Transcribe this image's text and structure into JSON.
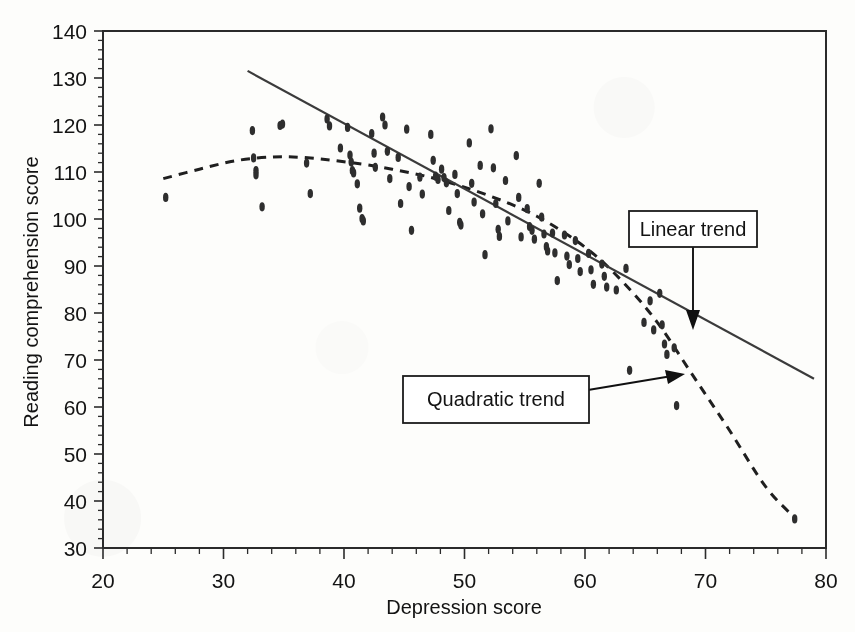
{
  "figure": {
    "background_color": "#fdfdfb",
    "axis_color": "#2b2b2b",
    "marker_color": "#2e2e2e",
    "linear_color": "#3b3b3b",
    "quadratic_color": "#1f1f1f"
  },
  "chart_data": {
    "type": "scatter",
    "title": "",
    "subtitle": "",
    "xlabel": "Depression score",
    "ylabel": "Reading comprehension score",
    "xlim": [
      20,
      80
    ],
    "ylim": [
      30,
      140
    ],
    "xticks": [
      20,
      30,
      40,
      50,
      60,
      70,
      80
    ],
    "yticks": [
      30,
      40,
      50,
      60,
      70,
      80,
      90,
      100,
      110,
      120,
      130,
      140
    ],
    "xtick_labels": [
      "20",
      "30",
      "40",
      "50",
      "60",
      "70",
      "80"
    ],
    "ytick_labels": [
      "30",
      "40",
      "50",
      "60",
      "70",
      "80",
      "90",
      "100",
      "110",
      "120",
      "130",
      "140"
    ],
    "xtick_minor_step": 2,
    "ytick_minor_step": 2,
    "grid": false,
    "legend": false,
    "legend_position": "none",
    "marker_shape": "filled-vertical-ellipse",
    "points": [
      [
        25.2,
        104.6
      ],
      [
        32.4,
        118.8
      ],
      [
        32.5,
        113.0
      ],
      [
        32.7,
        110.3
      ],
      [
        32.7,
        109.4
      ],
      [
        33.2,
        102.6
      ],
      [
        34.7,
        119.9
      ],
      [
        34.9,
        120.2
      ],
      [
        36.9,
        111.9
      ],
      [
        37.2,
        105.4
      ],
      [
        38.6,
        121.3
      ],
      [
        38.8,
        119.8
      ],
      [
        39.7,
        115.1
      ],
      [
        40.3,
        119.5
      ],
      [
        40.5,
        113.6
      ],
      [
        40.6,
        112.1
      ],
      [
        40.7,
        110.3
      ],
      [
        40.8,
        109.8
      ],
      [
        41.1,
        107.5
      ],
      [
        41.3,
        102.3
      ],
      [
        41.5,
        100.1
      ],
      [
        41.6,
        99.6
      ],
      [
        42.3,
        118.2
      ],
      [
        42.5,
        114.0
      ],
      [
        42.6,
        111.0
      ],
      [
        43.2,
        121.7
      ],
      [
        43.4,
        120.0
      ],
      [
        43.6,
        114.4
      ],
      [
        43.8,
        108.6
      ],
      [
        44.5,
        113.1
      ],
      [
        44.7,
        103.3
      ],
      [
        45.2,
        119.1
      ],
      [
        45.4,
        106.9
      ],
      [
        45.6,
        97.6
      ],
      [
        46.3,
        108.9
      ],
      [
        46.5,
        105.3
      ],
      [
        47.2,
        118.0
      ],
      [
        47.4,
        112.5
      ],
      [
        47.6,
        109.1
      ],
      [
        47.8,
        108.4
      ],
      [
        48.1,
        110.6
      ],
      [
        48.3,
        108.8
      ],
      [
        48.5,
        107.7
      ],
      [
        48.7,
        101.8
      ],
      [
        49.2,
        109.5
      ],
      [
        49.4,
        105.4
      ],
      [
        49.6,
        99.3
      ],
      [
        49.7,
        98.7
      ],
      [
        50.4,
        116.2
      ],
      [
        50.6,
        107.6
      ],
      [
        50.8,
        103.6
      ],
      [
        51.3,
        111.4
      ],
      [
        51.5,
        101.1
      ],
      [
        51.7,
        92.4
      ],
      [
        52.2,
        119.2
      ],
      [
        52.4,
        110.9
      ],
      [
        52.6,
        103.3
      ],
      [
        52.8,
        97.8
      ],
      [
        52.9,
        96.3
      ],
      [
        53.4,
        108.2
      ],
      [
        53.6,
        99.6
      ],
      [
        54.3,
        113.5
      ],
      [
        54.5,
        104.6
      ],
      [
        54.7,
        96.2
      ],
      [
        55.2,
        102.2
      ],
      [
        55.4,
        98.4
      ],
      [
        55.6,
        97.6
      ],
      [
        55.8,
        95.7
      ],
      [
        56.2,
        107.6
      ],
      [
        56.4,
        100.4
      ],
      [
        56.6,
        96.8
      ],
      [
        56.8,
        94.1
      ],
      [
        56.9,
        93.2
      ],
      [
        57.3,
        97.0
      ],
      [
        57.5,
        92.8
      ],
      [
        57.7,
        86.9
      ],
      [
        58.3,
        96.6
      ],
      [
        58.5,
        92.1
      ],
      [
        58.7,
        90.3
      ],
      [
        59.2,
        95.4
      ],
      [
        59.4,
        91.6
      ],
      [
        59.6,
        88.8
      ],
      [
        60.3,
        92.7
      ],
      [
        60.5,
        89.2
      ],
      [
        60.7,
        86.1
      ],
      [
        61.4,
        90.4
      ],
      [
        61.6,
        87.8
      ],
      [
        61.8,
        85.5
      ],
      [
        62.6,
        84.9
      ],
      [
        63.4,
        89.5
      ],
      [
        63.7,
        67.8
      ],
      [
        64.9,
        78.0
      ],
      [
        65.4,
        82.6
      ],
      [
        65.7,
        76.4
      ],
      [
        66.2,
        84.2
      ],
      [
        66.4,
        77.5
      ],
      [
        66.6,
        73.4
      ],
      [
        66.8,
        71.2
      ],
      [
        67.4,
        72.6
      ],
      [
        67.6,
        60.3
      ],
      [
        77.4,
        36.2
      ]
    ],
    "series": [
      {
        "name": "Linear trend",
        "type": "line",
        "style": "solid",
        "x": [
          32.0,
          79.0
        ],
        "y": [
          131.5,
          66.0
        ]
      },
      {
        "name": "Quadratic trend",
        "type": "line",
        "style": "dashed",
        "x": [
          25.0,
          28.0,
          31.0,
          34.0,
          36.5,
          40.0,
          44.0,
          48.0,
          52.0,
          56.0,
          60.0,
          63.0,
          66.0,
          69.0,
          72.0,
          75.0,
          77.5
        ],
        "y": [
          108.6,
          110.6,
          112.4,
          113.2,
          113.1,
          112.2,
          110.6,
          108.3,
          105.0,
          100.6,
          94.0,
          87.0,
          78.0,
          66.5,
          55.0,
          43.0,
          36.2
        ]
      }
    ],
    "annotations": [
      {
        "label": "Linear trend",
        "target_point": [
          69.0,
          79.5
        ],
        "arrow_direction": "down"
      },
      {
        "label": "Quadratic trend",
        "target_point": [
          68.8,
          66.5
        ],
        "arrow_direction": "right"
      }
    ]
  }
}
